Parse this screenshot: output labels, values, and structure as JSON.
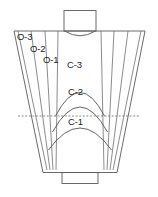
{
  "diagram": {
    "stroke_color": "#5a5a5a",
    "background_color": "#ffffff",
    "label_color": "#1c1c1c",
    "labels": {
      "o3": "O-3",
      "o2": "O-2",
      "o1": "O-1",
      "c3": "C-3",
      "c2": "C-2",
      "c1": "C-1"
    },
    "parts": {
      "top_neck": "top-neck-rectangle",
      "top_rim": "top-rim-line",
      "throat_curve": "throat-curve",
      "body": "flared-body-outline",
      "base": "base-rectangle",
      "datum": "horizontal-dashed-datum-line"
    },
    "zone_groups": [
      {
        "name": "O",
        "kind": "radiating-lines",
        "members": [
          "O-3",
          "O-2",
          "O-1"
        ]
      },
      {
        "name": "C",
        "kind": "nested-arcs",
        "members": [
          "C-3",
          "C-2",
          "C-1"
        ]
      }
    ]
  }
}
